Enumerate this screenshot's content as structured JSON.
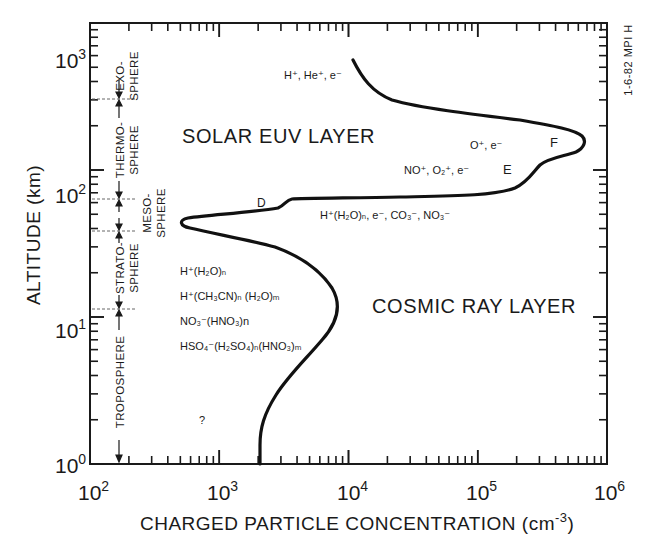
{
  "chart_data": {
    "type": "line",
    "title": "",
    "xlabel": "CHARGED PARTICLE CONCENTRATION (cm-3)",
    "xlabel_main": "CHARGED PARTICLE CONCENTRATION (cm",
    "xlabel_exp": "-3",
    "xlabel_close": ")",
    "ylabel": "ALTITUDE (km)",
    "xscale": "log",
    "yscale": "log",
    "xlim": [
      100,
      1000000
    ],
    "ylim": [
      1,
      1000
    ],
    "grid": false,
    "x_ticks": [
      {
        "base": "10",
        "exp": "2"
      },
      {
        "base": "10",
        "exp": "3"
      },
      {
        "base": "10",
        "exp": "4"
      },
      {
        "base": "10",
        "exp": "5"
      },
      {
        "base": "10",
        "exp": "6"
      }
    ],
    "y_ticks": [
      {
        "base": "10",
        "exp": "0"
      },
      {
        "base": "10",
        "exp": "1"
      },
      {
        "base": "10",
        "exp": "2"
      },
      {
        "base": "10",
        "exp": "3"
      }
    ],
    "series": [
      {
        "name": "Charged particle concentration profile",
        "x": [
          11000,
          25000,
          100000,
          300000,
          650000,
          300000,
          160000,
          20000,
          3300,
          2800,
          520,
          2200,
          5500,
          8300,
          6000,
          3000,
          2000,
          2000
        ],
        "y": [
          970,
          475,
          400,
          340,
          240,
          160,
          102,
          95,
          88,
          75,
          60,
          43,
          28,
          15,
          8,
          3.8,
          1.4,
          1
        ]
      }
    ],
    "annotations": {
      "solar_layer": "SOLAR EUV LAYER",
      "cosmic_layer": "COSMIC RAY LAYER",
      "region_d": "D",
      "region_e": "E",
      "region_f": "F",
      "question": "?",
      "stamp": "1-6-82 MPI H",
      "ions": {
        "exo": "H⁺, He⁺, e⁻",
        "f_region": "O⁺, e⁻",
        "e_region": "NO⁺, O₂⁺, e⁻",
        "d_region": "H⁺(H₂O)ₙ, e⁻, CO₃⁻, NO₃⁻",
        "strat_1": "H⁺(H₂O)ₙ",
        "strat_2": "H⁺(CH₃CN)ₙ (H₂O)ₘ",
        "strat_3": "NO₃⁻(HNO₃)n",
        "strat_4": "HSO₄⁻(H₂SO₄)ₙ(HNO₃)ₘ"
      },
      "atmosphere_layers": [
        {
          "line1": "EXO-",
          "line2": "SPHERE"
        },
        {
          "line1": "THERMO-",
          "line2": "SPHERE"
        },
        {
          "line1": "MESO-",
          "line2": "SPHERE"
        },
        {
          "line1": "STRATO-",
          "line2": "SPHERE"
        },
        {
          "line1": "TROPOSPHERE",
          "line2": ""
        }
      ],
      "layer_boundaries_km": [
        500,
        90,
        50,
        14
      ]
    }
  }
}
